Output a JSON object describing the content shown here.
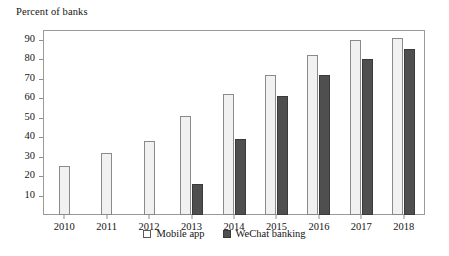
{
  "chart_data": {
    "type": "bar",
    "title": "Percent of banks",
    "xlabel": "",
    "ylabel": "",
    "ylim": [
      0,
      95
    ],
    "yticks": [
      10,
      20,
      30,
      40,
      50,
      60,
      70,
      80,
      90
    ],
    "grid": false,
    "legend_position": "bottom-center",
    "categories": [
      "2010",
      "2011",
      "2012",
      "2013",
      "2014",
      "2015",
      "2016",
      "2017",
      "2018"
    ],
    "series": [
      {
        "name": "Mobile app",
        "color": "#f1f1f1",
        "values": [
          25,
          32,
          38,
          51,
          62,
          72,
          82,
          90,
          91
        ]
      },
      {
        "name": "WeChat banking",
        "color": "#4f4f4f",
        "values": [
          null,
          null,
          null,
          16,
          39,
          61,
          72,
          80,
          85
        ]
      }
    ]
  },
  "legend": {
    "items": [
      {
        "label": "Mobile app",
        "swatch": "square-open-icon"
      },
      {
        "label": "WeChat banking",
        "swatch": "square-filled-icon"
      }
    ]
  }
}
